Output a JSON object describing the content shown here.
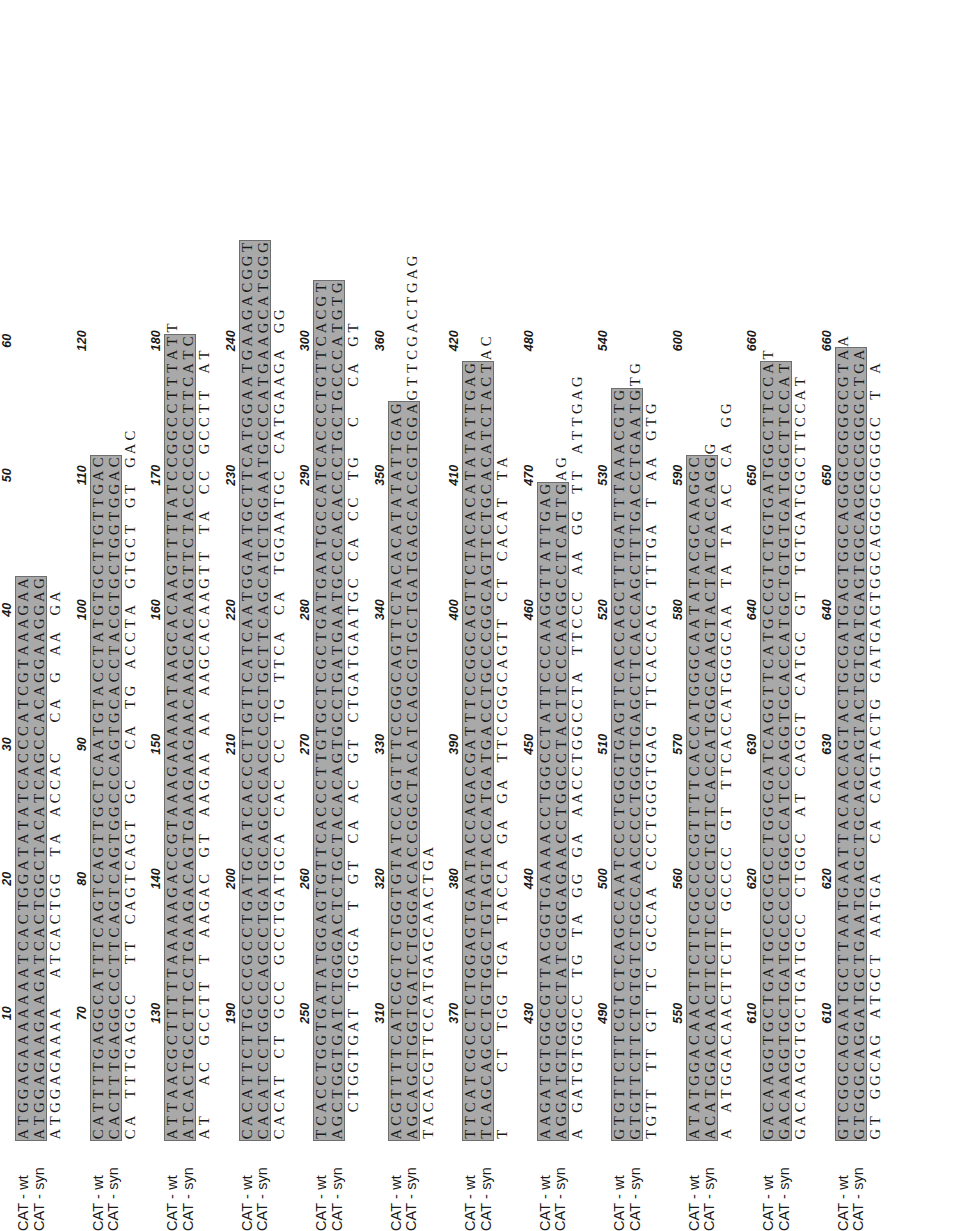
{
  "figure": {
    "type": "sequence-alignment",
    "orientation": "rotated-90-ccw",
    "track_labels": [
      "CAT - wt",
      "CAT - syn"
    ],
    "highlight_color": "#a9a9a9",
    "background_color": "#ffffff",
    "text_color": "#1a1a1a",
    "bases_per_block": 60,
    "tick_interval": 10,
    "total_length": 661,
    "blocks": [
      {
        "start": 1,
        "ticks": [
          "10",
          "20",
          "30",
          "40",
          "50",
          "60"
        ],
        "wt": "ATGGAGAAAAAAATCACTGGATATATCACCCATCGTAAAGAA",
        "syn": "ATGGAGAAGAAGATCACTGGCTACATCAGCCACAGGAAGGAG",
        "con": "ATGGAGAAAA  ATCACTGG TA ACCAC  CA G AA GA"
      },
      {
        "start": 43,
        "ticks": [
          "70",
          "80",
          "90",
          "100",
          "110",
          "120"
        ],
        "wt": "CATTTTGAGGCATTTCAGTCAGTTGCTCAATGTACCTATGTGCTTGTTGAC",
        "syn": "CACTTTGAGGCCCTTCAGTCAGTGGCCCAGTGCACCTACGTGCTGGTGGAC",
        "con": "CA TTTGAGGC  TT CAGTCAGT GC  CA TG ACCTA GTGCT GT GAC"
      },
      {
        "start": 94,
        "ticks": [
          "130",
          "140",
          "150",
          "160",
          "170",
          "180"
        ],
        "wt": "ATTAACGCTTTTTAAAAAGACCGTAAAGAAAAATAAGCACAAGTTTTATCCGGCCTTTATT",
        "syn": "ATCACTGCCTTCCTGAAGACAGTGAAGAAGAACAAGCACAAGTTCTACCCCGCCTTCATC",
        "con": "AT  AC GCCTT T AAGAC GT AAGAA AA AAGCACAAGTT TA CC GCCTT AT"
      },
      {
        "start": 154,
        "ticks": [
          "190",
          "200",
          "210",
          "220",
          "230",
          "240"
        ],
        "wt": "CACATTCTTGCCCGCCTGATGCATCACCCTTGTTCATCAATGGAATGCTTCATGGAATGAAGACGGT",
        "syn": "CACATCCTGGCCAGCCTGATGCAGCCCACCCCCTGCTTCAGCATCTGGAATGCCCATGAAGCATGGG",
        "con": "CACAT CT GCC GCCTGATGCA CAC CC TG TTCA CA TGGAATGC CATGAAGA GG"
      },
      {
        "start": 221,
        "ticks": [
          "250",
          "260",
          "270",
          "280",
          "290",
          "300"
        ],
        "wt": "TCACCTGGTGATATGGAGTGTTCACCCTTGTGCTCGCTGATGAATGCCATCACCCTGTTCACGT",
        "syn": "AGCTGGTGATCTGGGACTCTGCTACACAGTGCCTGATGAATGCCCACACCCTGCTGCCCATGTG",
        "con": "  CTGGTGAT TGGGA T GT CA AC GT CTGATGAATGC CA CC TG  C  CA GT"
      },
      {
        "start": 285,
        "ticks": [
          "310",
          "320",
          "330",
          "340",
          "350",
          "360"
        ],
        "wt": "ACGTTTTCATCGCTCTGGTGTATCCAGTTTCCGGCAGTTCTACACATATATTGAG",
        "syn": "AGCAGCTGGTGATCTGGGACACCGGCTACATCAGCGTGCTGATGAGCACCGTGGAGTTCGACTGAG",
        "con": "TACACGTTCCATGAGCAACTGA"
      },
      {
        "start": 360,
        "ticks": [
          "370",
          "380",
          "390",
          "400",
          "410",
          "420"
        ],
        "wt": "TTCATCGCCTCTGGAGTGAATACCAGACGATTTCCGGCAGTTCTACACATATATTGAG",
        "syn": "TCAGCAGCCTGTGGCTGTAGTACCATGATGACCTGCCCGGCAGTTCTGCACATCTACTAC",
        "con": "T    CT TGG TGA TACCA GA GA TTCCGGCAGTT CT CACAT TA"
      },
      {
        "start": 420,
        "ticks": [
          "430",
          "440",
          "450",
          "460",
          "470",
          "480"
        ],
        "wt": "AAGATGTGGCGTTACGGTGAAAACCTGGCCTATTCCCAAGGTTATTGAG",
        "syn": "AGGATGTGGCCTATCGGGAGAACCTGGCCTACTTCCCAAGGCCTCATTGAG",
        "con": "A GATGTGGCC TG TA GG GA AACCTGGCCTA TTCCC AA GG TT ATTGAG"
      },
      {
        "start": 480,
        "ticks": [
          "490",
          "500",
          "510",
          "520",
          "530",
          "540"
        ],
        "wt": "GTGTTCTTCGTCTCAGCCAATCCCTGGGTGAGTTCACCAGCTTTGATTTAAACGTG",
        "syn": "GTGTTCTTCTGTGTCTGCCAACCCCTGGGTGAGCTTCACCAGCTTTGACCTGAATGTG",
        "con": "TGTT TT GT TC GCCAA CCCTGGGTGAG TTCACCAG TTTGA T AA GTG"
      },
      {
        "start": 540,
        "ticks": [
          "550",
          "560",
          "570",
          "580",
          "590",
          "600"
        ],
        "wt": "ATATGGACAACTTCTTCGCCCCGTTTTCACCATGGGCAATATACGCAAGGC",
        "syn": "ACATGGACAACTTCTTCCCCCTGTTCACCATGGGCAAGTACTATCACCAGGG",
        "con": "A ATGGACAACTTCTT GCCCC GT TTCACCATGGGCAA TA TA AC CA GG"
      },
      {
        "start": 600,
        "ticks": [
          "610",
          "620",
          "630",
          "640",
          "650",
          "660"
        ],
        "wt": "GACAAGGTGCTGATGCCGCGCCTGGCGATCAGGTTCATGCCGTCTGTGATGGCTTCCAT",
        "syn": "GACAAGGTGCTGATGCCCCTGGCCATCCAGGTGCACCATGCTGTGTGATGGCTTCCAT",
        "con": "GACAAGGTGCTGATGCC CTGGC AT CAGGT CATGC GT TGTGATGGCTTCCAT"
      },
      {
        "start": 660,
        "ticks": [
          "610",
          "620",
          "630",
          "640",
          "650",
          "660"
        ],
        "wt": "GTCGGCAGAATGCTTAATGAATTACAACAGTACTGCGATGAGTGGCAGGGCGGGGCGTAA",
        "syn": "GTGGGCAGGATGCTGAATGAGCTGCAGCAGTACTGTGATGAGTGGCAGGGCGGGGCTGA",
        "con": "GT GGCAG ATGCT AATGA  CA CAGTACTG GATGAGTGGCAGGGCGGGGC T A"
      }
    ],
    "rows": [
      {
        "start": 1,
        "ticks": [
          {
            "label": "10",
            "pos": 10
          },
          {
            "label": "20",
            "pos": 20
          },
          {
            "label": "30",
            "pos": 30
          },
          {
            "label": "40",
            "pos": 40
          },
          {
            "label": "50",
            "pos": 50
          },
          {
            "label": "60",
            "pos": 60
          }
        ],
        "wt": [
          "A",
          "T",
          "G",
          "G",
          "A",
          "G",
          "A",
          "A",
          "A",
          "A",
          "A",
          "A",
          "A",
          "T",
          "C",
          "A",
          "C",
          "T",
          "G",
          "G",
          "A",
          "T",
          "A",
          "T",
          "A",
          "T",
          "C",
          "A",
          "C",
          "C",
          "C",
          "A",
          "T",
          "C",
          "G",
          "T",
          "A",
          "A",
          "A",
          "G",
          "A",
          "A"
        ],
        "syn": [
          "A",
          "T",
          "G",
          "G",
          "A",
          "G",
          "A",
          "A",
          "G",
          "A",
          "A",
          "G",
          "A",
          "T",
          "C",
          "A",
          "C",
          "T",
          "G",
          "G",
          "C",
          "T",
          "A",
          "C",
          "A",
          "T",
          "C",
          "A",
          "G",
          "C",
          "C",
          "A",
          "C",
          "A",
          "G",
          "G",
          "A",
          "A",
          "G",
          "G",
          "A",
          "G"
        ],
        "con": [
          "A",
          "T",
          "G",
          "G",
          "A",
          "G",
          "A",
          "A",
          "A",
          "A",
          " ",
          " ",
          "A",
          "T",
          "C",
          "A",
          "C",
          "T",
          "G",
          "G",
          " ",
          "T",
          "A",
          " ",
          "A",
          "C",
          "C",
          "A",
          "C",
          " ",
          " ",
          "C",
          "A",
          " ",
          "G",
          " ",
          "A",
          "A",
          " ",
          "G",
          "A",
          " "
        ],
        "hl": [
          1,
          1,
          1,
          1,
          1,
          1,
          1,
          1,
          1,
          1,
          1,
          1,
          1,
          1,
          1,
          1,
          1,
          1,
          1,
          1,
          1,
          1,
          1,
          1,
          1,
          1,
          1,
          1,
          1,
          1,
          1,
          1,
          1,
          1,
          1,
          1,
          1,
          1,
          1,
          1,
          1,
          1
        ],
        "boxes": [
          [
            0,
            8
          ],
          [
            8,
            2
          ],
          [
            12,
            8
          ],
          [
            20,
            2
          ],
          [
            22,
            2
          ],
          [
            24,
            2
          ],
          [
            26,
            5
          ],
          [
            31,
            3
          ],
          [
            34,
            2
          ],
          [
            36,
            4
          ],
          [
            40,
            2
          ]
        ]
      }
    ]
  },
  "chart_data": {
    "type": "table",
    "series": [
      {
        "name": "CAT - wt"
      },
      {
        "name": "CAT - syn"
      }
    ]
  }
}
